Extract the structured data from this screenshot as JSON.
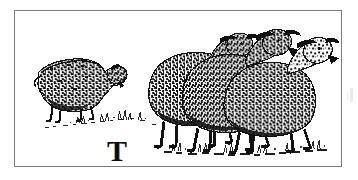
{
  "image": {
    "kind": "engraving-illustration",
    "style": "woodcut",
    "background_color": "#ffffff",
    "ink_color": "#111111",
    "frame": {
      "border_color": "#7c7c80",
      "border_width_px": 1,
      "x": 14,
      "y": 10,
      "width": 328,
      "height": 157
    }
  },
  "caption": {
    "drop_cap": "T"
  },
  "scene": {
    "title": "Sheep in a pasture",
    "description": "A grazing sheep at left faces a group of three standing sheep at right, above a sparse line of grass.",
    "ground_line_label": "grass-tufts",
    "subjects": [
      {
        "name": "grazing-sheep",
        "label": "Grazing sheep",
        "pose": "head lowered, feeding",
        "facing": "right",
        "x": 33,
        "y": 60,
        "width": 72,
        "height": 55
      },
      {
        "name": "standing-sheep-rear",
        "label": "Rear sheep",
        "pose": "standing",
        "facing": "right",
        "x": 148,
        "y": 24,
        "width": 120,
        "height": 105
      },
      {
        "name": "standing-sheep-middle",
        "label": "Middle sheep",
        "pose": "standing",
        "facing": "right",
        "x": 185,
        "y": 22,
        "width": 120,
        "height": 108
      },
      {
        "name": "standing-sheep-front",
        "label": "Front sheep",
        "pose": "standing",
        "facing": "right",
        "x": 228,
        "y": 28,
        "width": 112,
        "height": 102
      }
    ]
  }
}
